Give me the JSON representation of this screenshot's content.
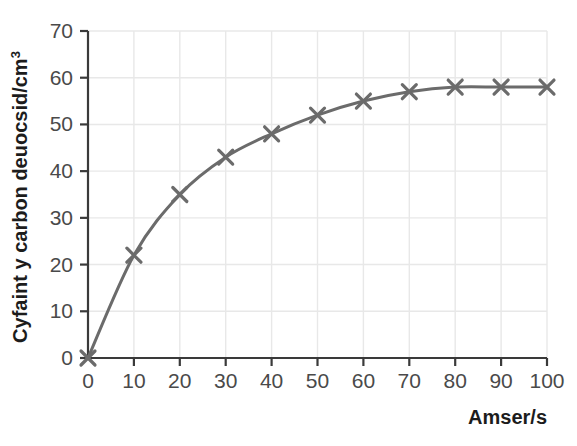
{
  "chart_data": {
    "type": "line",
    "title": "",
    "xlabel": "Amser/s",
    "ylabel": "Cyfaint y carbon deuocsid/cm",
    "ylabel_superscript": "3",
    "ylabel_full": "Cyfaint y carbon deuocsid/cm³",
    "x": [
      0,
      10,
      20,
      30,
      40,
      50,
      60,
      70,
      80,
      90,
      100
    ],
    "values": [
      0,
      22,
      35,
      43,
      48,
      52,
      55,
      57,
      58,
      58,
      58
    ],
    "series": [
      {
        "name": "Cyfaint y carbon deuocsid",
        "values": [
          0,
          22,
          35,
          43,
          48,
          52,
          55,
          57,
          58,
          58,
          58
        ]
      }
    ],
    "xticks": [
      "0",
      "10",
      "20",
      "30",
      "40",
      "50",
      "60",
      "70",
      "80",
      "90",
      "100"
    ],
    "yticks": [
      "0",
      "10",
      "20",
      "30",
      "40",
      "50",
      "60",
      "70"
    ],
    "xlim": [
      0,
      100
    ],
    "ylim": [
      0,
      70
    ],
    "grid": true,
    "legend": false,
    "marker": "x",
    "line_color": "#6b6b6b",
    "marker_color": "#6b6b6b",
    "grid_color": "#e8e8e8",
    "axis_color": "#3a3a3a",
    "tick_label_color": "#4a4a4a",
    "axis_title_color": "#1c1c1c",
    "background_color": "#ffffff"
  }
}
